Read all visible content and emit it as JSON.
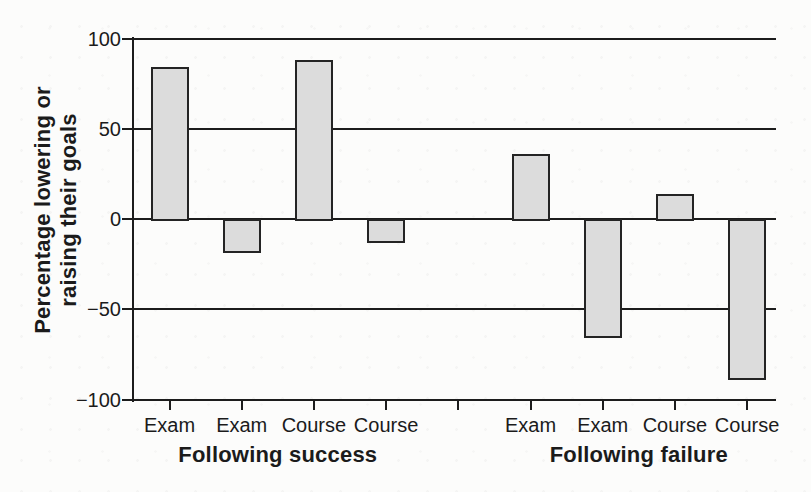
{
  "chart_data": {
    "type": "bar",
    "title": "",
    "ylabel": "Percentage lowering or raising their goals",
    "ylabel_lines": [
      "Percentage lowering or",
      "raising their goals"
    ],
    "ylim": [
      -100,
      100
    ],
    "y_ticks": [
      {
        "value": 100,
        "label": "100"
      },
      {
        "value": 50,
        "label": "50"
      },
      {
        "value": 0,
        "label": "0"
      },
      {
        "value": -50,
        "label": "−50"
      },
      {
        "value": -100,
        "label": "−100"
      }
    ],
    "gridline_values": [
      100,
      50,
      0,
      -50
    ],
    "baseline_value": -100,
    "grid": "horizontal lines at 100, 50, 0, -50; baseline at -100",
    "legend": "none",
    "groups": [
      {
        "label": "Following success",
        "categories": [
          "Exam",
          "Exam",
          "Course",
          "Course"
        ],
        "values": [
          84,
          -18,
          88,
          -12
        ]
      },
      {
        "label": "Following failure",
        "categories": [
          "Exam",
          "Exam",
          "Course",
          "Course"
        ],
        "values": [
          36,
          -65,
          14,
          -88
        ]
      }
    ],
    "unlabeled_tick_between_groups": true,
    "colors": {
      "bar_fill": "#dcdcdc",
      "bar_border": "#242424",
      "axis_line": "#1c1c1c",
      "text": "#1b1b1b",
      "background": "#fcfcfb"
    }
  }
}
